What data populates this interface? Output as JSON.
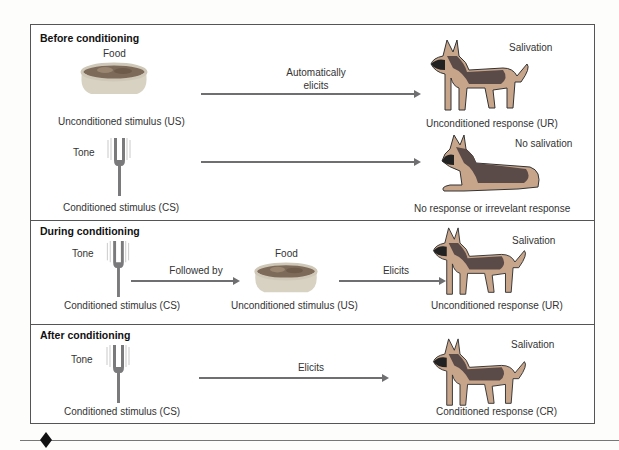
{
  "diagram": {
    "sections": [
      {
        "title": "Before conditioning",
        "rows": [
          {
            "stimulus_caption": "Food",
            "stimulus_label": "Unconditioned stimulus (US)",
            "stimulus_icon": "food-bowl-icon",
            "arrow_label_line1": "Automatically",
            "arrow_label_line2": "elicits",
            "response_caption": "Salivation",
            "response_label": "Unconditioned response (UR)",
            "response_icon": "standing-dog-icon"
          },
          {
            "stimulus_caption": "Tone",
            "stimulus_label": "Conditioned stimulus (CS)",
            "stimulus_icon": "tuning-fork-icon",
            "arrow_label_line1": "",
            "arrow_label_line2": "",
            "response_caption": "No salivation",
            "response_label": "No response or irrevelant response",
            "response_icon": "lying-dog-icon"
          }
        ]
      },
      {
        "title": "During conditioning",
        "stimulus_caption": "Tone",
        "stimulus_label": "Conditioned stimulus (CS)",
        "stimulus_icon": "tuning-fork-icon",
        "arrow1_label": "Followed by",
        "middle_caption": "Food",
        "middle_label": "Unconditioned stimulus (US)",
        "middle_icon": "food-bowl-icon",
        "arrow2_label": "Elicits",
        "response_caption": "Salivation",
        "response_label": "Unconditioned response (UR)",
        "response_icon": "standing-dog-icon"
      },
      {
        "title": "After conditioning",
        "stimulus_caption": "Tone",
        "stimulus_label": "Conditioned stimulus (CS)",
        "stimulus_icon": "tuning-fork-icon",
        "arrow_label": "Elicits",
        "response_caption": "Salivation",
        "response_label": "Conditioned response (CR)",
        "response_icon": "standing-dog-icon"
      }
    ]
  },
  "colors": {
    "arrow": "#6f6f72",
    "border": "#555555",
    "bowl": "#d9d3c4",
    "food": "#8a7560",
    "dog_dark": "#5a4a48",
    "dog_tan": "#c7a58b"
  }
}
